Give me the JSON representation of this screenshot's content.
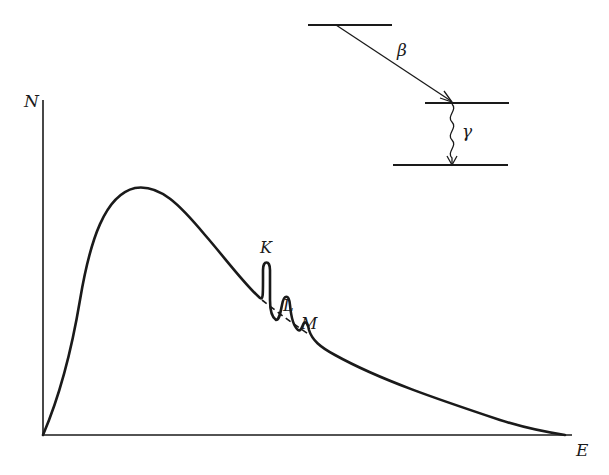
{
  "diagram": {
    "type": "beta-decay energy spectrum with internal conversion lines",
    "colors": {
      "ink": "#1a1a1a",
      "background": "#ffffff"
    },
    "axes": {
      "y_label": "N",
      "x_label": "E"
    },
    "spectrum": {
      "description": "continuous beta spectrum rising from origin to a broad maximum, then decaying to zero at the endpoint",
      "dashed_continuum_under_peaks": true
    },
    "peaks": [
      {
        "label": "K",
        "relative_height": "tallest"
      },
      {
        "label": "L",
        "relative_height": "medium"
      },
      {
        "label": "M",
        "relative_height": "small"
      }
    ],
    "level_scheme": {
      "levels": [
        "initial",
        "intermediate",
        "ground"
      ],
      "transitions": [
        {
          "label": "β",
          "from": "initial",
          "to": "intermediate",
          "style": "straight-arrow"
        },
        {
          "label": "γ",
          "from": "intermediate",
          "to": "ground",
          "style": "wavy-arrow"
        }
      ]
    }
  }
}
